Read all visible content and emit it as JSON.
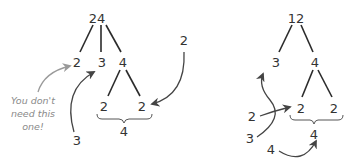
{
  "colors": {
    "text": "#333333",
    "edge": "#2b2b2b",
    "annotation": "#8a8a8a",
    "arrow_dark": "#444444",
    "arrow_gray": "#9a9a9a"
  },
  "left_tree": {
    "root": "24",
    "children": [
      "2",
      "3",
      "4"
    ],
    "grandchildren": [
      "2",
      "2"
    ],
    "brace_value": "4",
    "annotation": {
      "line1": "You don't",
      "line2": "need this",
      "line3": "one!"
    },
    "callout_three": "3",
    "callout_two": "2"
  },
  "right_tree": {
    "root": "12",
    "children": [
      "3",
      "4"
    ],
    "grandchildren": [
      "2",
      "2"
    ],
    "brace_value": "4",
    "callout_two": "2",
    "callout_three": "3",
    "callout_four": "4"
  }
}
